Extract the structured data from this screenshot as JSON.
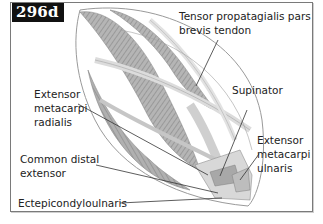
{
  "figure": {
    "number": "296d",
    "type": "anatomical diagram - wing forearm muscles (extensor side)"
  },
  "labels": [
    {
      "id": "tensor",
      "lines": [
        "Tensor propatagialis pars",
        "brevis tendon"
      ]
    },
    {
      "id": "supinator",
      "lines": [
        "Supinator"
      ]
    },
    {
      "id": "emr",
      "lines": [
        "Extensor",
        "metacarpi",
        "radialis"
      ]
    },
    {
      "id": "emu",
      "lines": [
        "Extensor",
        "metacarpi",
        "ulnaris"
      ]
    },
    {
      "id": "cde",
      "lines": [
        "Common distal",
        "extensor"
      ]
    },
    {
      "id": "ecu",
      "lines": [
        "Ectepicondyloulnaris"
      ]
    }
  ],
  "colors": {
    "frame": "#7a7a7a",
    "muscle_dark": "#9a9a9a",
    "muscle_light": "#d9d9d9",
    "outline": "#8c8c8c",
    "leader": "#333333",
    "badge_bg": "#111111"
  }
}
